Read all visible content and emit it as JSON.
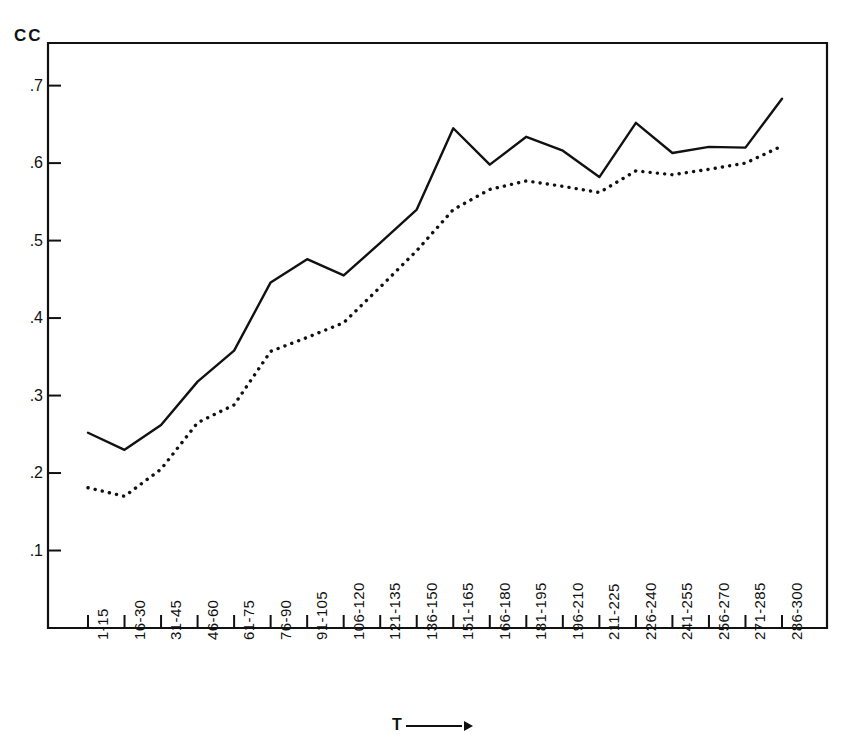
{
  "chart_data": {
    "type": "line",
    "title": "",
    "xlabel": "T",
    "ylabel": "CC",
    "y_unit_label": "CC",
    "x_axis_arrow": true,
    "grid": false,
    "legend": "none",
    "ylim": [
      0.0,
      0.755
    ],
    "yticks": [
      0.7,
      0.6,
      0.5,
      0.4,
      0.3,
      0.2,
      0.1
    ],
    "ytick_labels": [
      ".7",
      ".6",
      ".5",
      ".4",
      ".3",
      ".2",
      ".1"
    ],
    "categories": [
      "1-15",
      "16-30",
      "31-45",
      "46-60",
      "61-75",
      "76-90",
      "91-105",
      "106-120",
      "121-135",
      "136-150",
      "151-165",
      "166-180",
      "181-195",
      "196-210",
      "211-225",
      "226-240",
      "241-255",
      "256-270",
      "271-285",
      "286-300"
    ],
    "series": [
      {
        "name": "solid-curve",
        "style": "solid",
        "color": "#111111",
        "values": [
          0.252,
          0.23,
          0.262,
          0.318,
          0.358,
          0.446,
          0.476,
          0.455,
          0.497,
          0.54,
          0.645,
          0.598,
          0.634,
          0.616,
          0.582,
          0.652,
          0.613,
          0.621,
          0.62,
          0.683
        ]
      },
      {
        "name": "dotted-curve",
        "style": "dotted",
        "color": "#111111",
        "values": [
          0.181,
          0.17,
          0.205,
          0.265,
          0.288,
          0.357,
          0.375,
          0.394,
          0.44,
          0.487,
          0.54,
          0.566,
          0.577,
          0.57,
          0.562,
          0.59,
          0.585,
          0.592,
          0.6,
          0.622
        ]
      }
    ]
  }
}
